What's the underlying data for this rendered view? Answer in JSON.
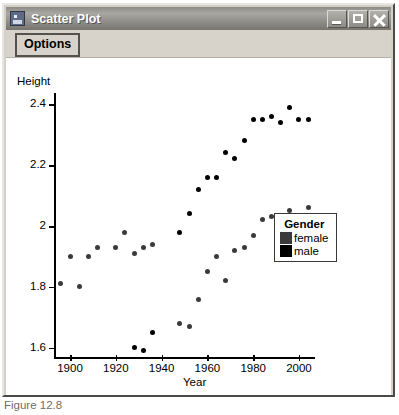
{
  "window": {
    "title": "Scatter Plot",
    "icon": "application-window-icon",
    "controls": [
      {
        "name": "minimize-button",
        "glyph": "_"
      },
      {
        "name": "maximize-button",
        "glyph": "□"
      },
      {
        "name": "close-button",
        "glyph": "✕"
      }
    ]
  },
  "toolbar": {
    "options_label": "Options"
  },
  "legend": {
    "title": "Gender",
    "entries": [
      {
        "label": "female",
        "color": "#3a3a3a"
      },
      {
        "label": "male",
        "color": "#000000"
      }
    ]
  },
  "caption": "Figure 12.8",
  "chart_data": {
    "type": "scatter",
    "title": "Scatter Plot",
    "xlabel": "Year",
    "ylabel": "Height",
    "xlim": [
      1893,
      2007
    ],
    "ylim": [
      1.57,
      2.43
    ],
    "xticks": [
      1900,
      1920,
      1940,
      1960,
      1980,
      2000
    ],
    "yticks": [
      "1.6",
      "1.8",
      "2",
      "2.2",
      "2.4"
    ],
    "ytick_values": [
      1.6,
      1.8,
      2.0,
      2.2,
      2.4
    ],
    "grid": false,
    "legend_position": "right",
    "series": [
      {
        "name": "female",
        "color": "#3a3a3a",
        "points": [
          [
            1896,
            1.81
          ],
          [
            1900,
            1.9
          ],
          [
            1904,
            1.8
          ],
          [
            1908,
            1.9
          ],
          [
            1912,
            1.93
          ],
          [
            1920,
            1.93
          ],
          [
            1924,
            1.98
          ],
          [
            1928,
            1.91
          ],
          [
            1932,
            1.93
          ],
          [
            1936,
            1.94
          ],
          [
            1948,
            1.68
          ],
          [
            1952,
            1.67
          ],
          [
            1956,
            1.76
          ],
          [
            1960,
            1.85
          ],
          [
            1964,
            1.9
          ],
          [
            1968,
            1.82
          ],
          [
            1972,
            1.92
          ],
          [
            1976,
            1.93
          ],
          [
            1980,
            1.97
          ],
          [
            1984,
            2.02
          ],
          [
            1988,
            2.03
          ],
          [
            1992,
            2.02
          ],
          [
            1996,
            2.05
          ],
          [
            2000,
            2.01
          ],
          [
            2004,
            2.06
          ]
        ]
      },
      {
        "name": "male",
        "color": "#000000",
        "points": [
          [
            1928,
            1.6
          ],
          [
            1932,
            1.59
          ],
          [
            1936,
            1.65
          ],
          [
            1948,
            1.98
          ],
          [
            1952,
            2.04
          ],
          [
            1956,
            2.12
          ],
          [
            1960,
            2.16
          ],
          [
            1964,
            2.16
          ],
          [
            1968,
            2.24
          ],
          [
            1972,
            2.22
          ],
          [
            1976,
            2.28
          ],
          [
            1980,
            2.35
          ],
          [
            1984,
            2.35
          ],
          [
            1988,
            2.36
          ],
          [
            1992,
            2.34
          ],
          [
            1996,
            2.39
          ],
          [
            2000,
            2.35
          ],
          [
            2004,
            2.35
          ]
        ]
      }
    ]
  }
}
